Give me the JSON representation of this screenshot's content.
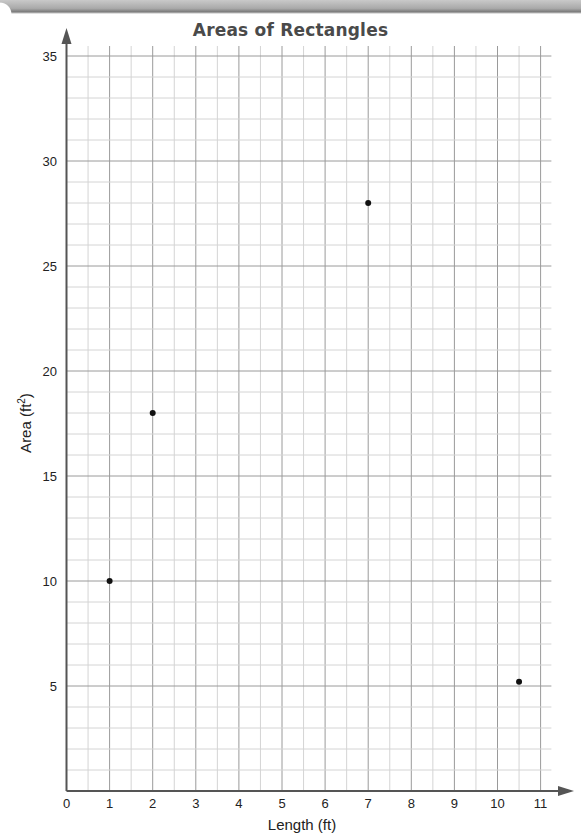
{
  "chart_data": {
    "type": "scatter",
    "title": "Areas of Rectangles",
    "xlabel": "Length (ft)",
    "ylabel": "Area (ft²)",
    "xlim": [
      0,
      11.25
    ],
    "ylim": [
      0,
      35
    ],
    "x_ticks": [
      0,
      1,
      2,
      3,
      4,
      5,
      6,
      7,
      8,
      9,
      10,
      11
    ],
    "y_ticks": [
      5,
      10,
      15,
      20,
      25,
      30,
      35
    ],
    "grid": true,
    "legend": null,
    "points": [
      {
        "x": 1,
        "y": 10
      },
      {
        "x": 2,
        "y": 18
      },
      {
        "x": 7,
        "y": 28
      },
      {
        "x": 10.5,
        "y": 5.2
      }
    ],
    "colors": {
      "grid_major": "#9a9a9a",
      "grid_minor": "#d4d4d4",
      "axis": "#555555",
      "point": "#111111"
    }
  },
  "labels": {
    "title": "Areas of Rectangles",
    "xlabel": "Length (ft)",
    "ylabel_main": "Area (ft",
    "ylabel_sup": "2",
    "ylabel_end": ")"
  }
}
